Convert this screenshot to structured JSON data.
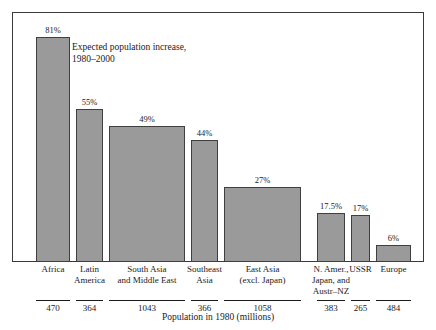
{
  "chart_data": {
    "type": "bar",
    "title": "",
    "subtitle": "",
    "annotation": {
      "line1": "Expected population increase,",
      "line2": "1980–2000"
    },
    "xlabel": "Population in 1980 (millions)",
    "ylabel": "",
    "ylim": [
      0,
      90
    ],
    "grid": false,
    "legend": "none",
    "value_suffix": "%",
    "note": "Variable-width bar chart: bar width is proportional to 1980 population (millions); bar height is the expected percent population increase 1980-2000.",
    "categories": [
      "Africa",
      "Latin America",
      "South Asia and Middle East",
      "Southeast Asia",
      "East Asia (excl. Japan)",
      "N. Amer., Japan, and Austr–NZ",
      "USSR",
      "Europe"
    ],
    "category_lines": [
      [
        "Africa"
      ],
      [
        "Latin",
        "America"
      ],
      [
        "South Asia",
        "and Middle East"
      ],
      [
        "Southeast",
        "Asia"
      ],
      [
        "East Asia",
        "(excl. Japan)"
      ],
      [
        "N. Amer.,",
        "Japan, and",
        "Austr–NZ"
      ],
      [
        "USSR"
      ],
      [
        "Europe"
      ]
    ],
    "values": [
      81,
      55,
      49,
      44,
      27,
      17.5,
      17,
      6
    ],
    "value_labels": [
      "81%",
      "55%",
      "49%",
      "44%",
      "27%",
      "17.5%",
      "17%",
      "6%"
    ],
    "widths": [
      470,
      364,
      1043,
      366,
      1058,
      383,
      265,
      484
    ],
    "width_labels": [
      "470",
      "364",
      "1043",
      "366",
      "1058",
      "383",
      "265",
      "484"
    ],
    "colors": {
      "bar_fill": "#9a9a9a",
      "bar_stroke": "#3f3f3f",
      "frame": "#3a3a3a",
      "text": "#1a1a1a",
      "background": "#ffffff"
    }
  }
}
